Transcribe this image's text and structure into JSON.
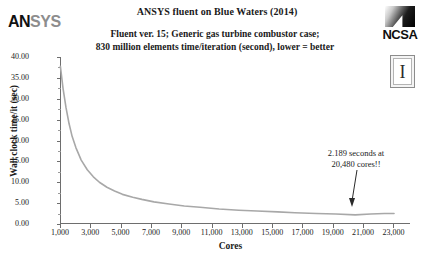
{
  "header": {
    "title": "ANSYS fluent on Blue Waters (2014)",
    "subtitle_line1": "Fluent ver. 15; Generic gas turbine combustor case;",
    "subtitle_line2": "830 million elements time/iteration (second), lower = better"
  },
  "logos": {
    "ansys_bold": "AN",
    "ansys_light": "SYS",
    "ncsa_text": "NCSA",
    "illinois_letter": "I"
  },
  "annotation": {
    "line1": "2.189 seconds at",
    "line2": "20,480 cores!!"
  },
  "colors": {
    "series_line": "#a8a8a8",
    "axis": "#6e6e6e",
    "text": "#1a1a1a",
    "ansys_bold": "#111111",
    "ansys_light": "#8d8d8d"
  },
  "chart_data": {
    "type": "line",
    "title": "ANSYS fluent on Blue Waters (2014)",
    "subtitle": "Fluent ver. 15; Generic gas turbine combustor case; 830 million elements time/iteration (second), lower = better",
    "xlabel": "Cores",
    "ylabel": "Wall clock time/it (sec)",
    "xlim": [
      1000,
      23500
    ],
    "ylim": [
      0,
      40
    ],
    "ytick_values": [
      0,
      5,
      10,
      15,
      20,
      25,
      30,
      35,
      40
    ],
    "ytick_labels": [
      "0.00",
      "5.00",
      "10.00",
      "15.00",
      "20.00",
      "25.00",
      "30.00",
      "35.00",
      "40.00"
    ],
    "xtick_values": [
      1000,
      3000,
      5000,
      7000,
      9000,
      11000,
      13000,
      15000,
      17000,
      19000,
      21000,
      23000
    ],
    "xtick_labels": [
      "1,000",
      "3,000",
      "5,000",
      "7,000",
      "9,000",
      "11,000",
      "13,000",
      "15,000",
      "17,000",
      "19,000",
      "21,000",
      "23,000"
    ],
    "grid": false,
    "legend": false,
    "series": [
      {
        "name": "Wall clock time per iteration",
        "x": [
          1024,
          1200,
          1400,
          1600,
          1800,
          2048,
          2400,
          2800,
          3200,
          3600,
          4096,
          4600,
          5120,
          5800,
          6400,
          7200,
          8192,
          9200,
          10240,
          11500,
          12800,
          14000,
          15360,
          16500,
          17920,
          19200,
          20480,
          21500,
          22400,
          23040
        ],
        "y": [
          37.8,
          32.5,
          27.8,
          24.0,
          21.0,
          18.3,
          15.3,
          13.0,
          11.3,
          10.0,
          8.8,
          7.9,
          7.1,
          6.4,
          5.9,
          5.3,
          4.8,
          4.3,
          4.0,
          3.6,
          3.3,
          3.1,
          2.9,
          2.7,
          2.5,
          2.4,
          2.189,
          2.4,
          2.5,
          2.5
        ]
      }
    ],
    "annotations": [
      {
        "text": "2.189 seconds at 20,480 cores!!",
        "x": 20480,
        "y": 2.189
      }
    ]
  }
}
